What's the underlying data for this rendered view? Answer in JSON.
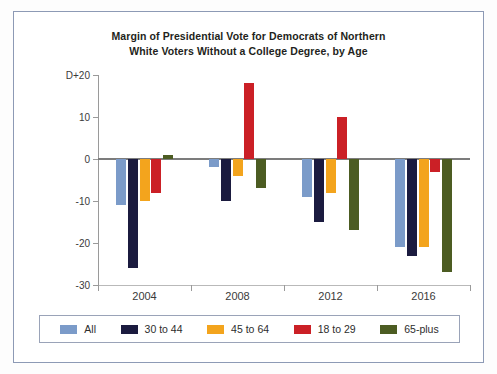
{
  "chart_data": {
    "type": "bar",
    "title": "Margin of Presidential Vote for Democrats of Northern White Voters Without a College Degree, by Age",
    "title_line1": "Margin of Presidential Vote for Democrats of Northern",
    "title_line2": "White Voters Without a College Degree, by Age",
    "xlabel": "",
    "ylabel": "",
    "categories": [
      "2004",
      "2008",
      "2012",
      "2016"
    ],
    "ylim": [
      -30,
      20
    ],
    "yticks": [
      20,
      10,
      0,
      -10,
      -20,
      -30
    ],
    "ytick_labels": [
      "D+20",
      "10",
      "0",
      "-10",
      "-20",
      "-30"
    ],
    "grid": false,
    "legend_position": "bottom",
    "series": [
      {
        "name": "All",
        "color": "#7b9bc9",
        "values": [
          -11,
          -2,
          -9,
          -21
        ]
      },
      {
        "name": "30 to 44",
        "color": "#1b1b3f",
        "values": [
          -26,
          -10,
          -15,
          -23
        ]
      },
      {
        "name": "45 to 64",
        "color": "#f3a41d",
        "values": [
          -10,
          -4,
          -8,
          -21
        ]
      },
      {
        "name": "18 to 29",
        "color": "#cb2026",
        "values": [
          -8,
          18,
          10,
          -3
        ]
      },
      {
        "name": "65-plus",
        "color": "#4c5c22",
        "values": [
          1,
          -7,
          -17,
          -27
        ]
      }
    ]
  },
  "legend": {
    "items": [
      {
        "label": "All",
        "color": "#7b9bc9"
      },
      {
        "label": "30 to 44",
        "color": "#1b1b3f"
      },
      {
        "label": "45 to 64",
        "color": "#f3a41d"
      },
      {
        "label": "18 to 29",
        "color": "#cb2026"
      },
      {
        "label": "65-plus",
        "color": "#4c5c22"
      }
    ]
  },
  "colors": {
    "frame": "#8d9ab5",
    "axis": "#9a9a9a",
    "zero_line": "#7c7c7c",
    "text": "#231f20",
    "background": "#ffffff"
  }
}
